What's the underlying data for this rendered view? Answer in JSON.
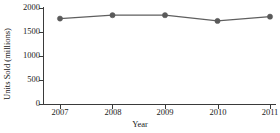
{
  "chart_data": {
    "type": "line",
    "title": "",
    "subtitle": "",
    "xlabel": "Year",
    "ylabel": "Units Sold (millions)",
    "categories": [
      "2007",
      "2008",
      "2009",
      "2010",
      "2011"
    ],
    "x": [
      2007,
      2008,
      2009,
      2010,
      2011
    ],
    "values": [
      1780,
      1850,
      1850,
      1730,
      1820
    ],
    "series": [
      {
        "name": "Units Sold",
        "values": [
          1780,
          1850,
          1850,
          1730,
          1820
        ]
      }
    ],
    "xlim": [
      2007,
      2011
    ],
    "ylim": [
      0,
      2000
    ],
    "yticks": [
      0,
      500,
      1000,
      1500,
      2000
    ],
    "ytick_labels": [
      "0",
      "500",
      "1000",
      "1500",
      "2000"
    ],
    "xticks": [
      2007,
      2008,
      2009,
      2010,
      2011
    ],
    "xtick_labels": [
      "2007",
      "2008",
      "2009",
      "2010",
      "2011"
    ],
    "grid": false,
    "legend": false,
    "legend_position": "none",
    "marker": "circle",
    "annotations": []
  },
  "style": {
    "line_color": "#5f5f5f",
    "marker_color": "#5a5a5a",
    "axis_color": "#3a3a3a",
    "text_color": "#1a1a1a",
    "background": "#ffffff"
  }
}
